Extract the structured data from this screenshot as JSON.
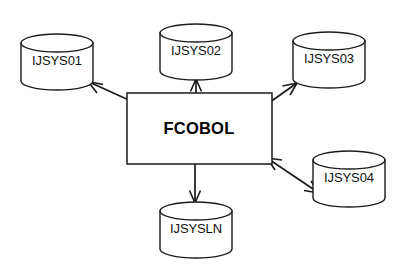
{
  "diagram": {
    "background_color": "#ffffff",
    "stroke_color": "#1a1a1a",
    "process": {
      "label": "FCOBOL",
      "shape": "rectangle",
      "x": 127,
      "y": 93,
      "width": 145,
      "height": 71,
      "center_x": 199,
      "center_y": 129
    },
    "nodes": [
      {
        "id": "ijsys01",
        "label": "IJSYS01",
        "shape": "cylinder",
        "cx": 57,
        "cy": 58,
        "rx": 36,
        "ry": 9,
        "body_top": 34,
        "body_bottom": 81
      },
      {
        "id": "ijsys02",
        "label": "IJSYS02",
        "shape": "cylinder",
        "cx": 196,
        "cy": 48,
        "rx": 36,
        "ry": 9,
        "body_top": 24,
        "body_bottom": 71
      },
      {
        "id": "ijsys03",
        "label": "IJSYS03",
        "shape": "cylinder",
        "cx": 329,
        "cy": 56,
        "rx": 36,
        "ry": 9,
        "body_top": 32,
        "body_bottom": 79
      },
      {
        "id": "ijsys04",
        "label": "IJSYS04",
        "shape": "cylinder",
        "cx": 349,
        "cy": 175,
        "rx": 36,
        "ry": 9,
        "body_top": 151,
        "body_bottom": 198
      },
      {
        "id": "ijsysln",
        "label": "IJSYSLN",
        "shape": "cylinder",
        "cx": 196,
        "cy": 226,
        "rx": 36,
        "ry": 9,
        "body_top": 202,
        "body_bottom": 249
      }
    ],
    "edges": [
      {
        "id": "edge-fcobol-ijsys01",
        "from": "fcobol",
        "to": "ijsys01",
        "direction": "bidirectional",
        "arrowheads": 2
      },
      {
        "id": "edge-fcobol-ijsys02",
        "from": "fcobol",
        "to": "ijsys02",
        "direction": "bidirectional",
        "arrowheads": 2
      },
      {
        "id": "edge-fcobol-ijsys03",
        "from": "fcobol",
        "to": "ijsys03",
        "direction": "bidirectional",
        "arrowheads": 2
      },
      {
        "id": "edge-fcobol-ijsys04",
        "from": "fcobol",
        "to": "ijsys04",
        "direction": "bidirectional",
        "arrowheads": 2
      },
      {
        "id": "edge-fcobol-ijsysln",
        "from": "fcobol",
        "to": "ijsysln",
        "direction": "unidirectional",
        "arrowheads": 1
      }
    ]
  }
}
